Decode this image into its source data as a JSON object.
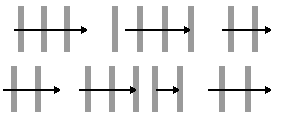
{
  "figure": {
    "width": 281,
    "height": 118,
    "background_color": "#ffffff",
    "bar_color": "#9a9a9a",
    "arrow_color": "#000000",
    "bar_width": 6,
    "arrow_line_thickness": 2,
    "panel_count": 7,
    "rows": 2
  },
  "panels": [
    {
      "id": "panel-1",
      "position": "top-left",
      "bar_count": 3,
      "bars": [
        {
          "x": 18,
          "y": 6,
          "width": 6,
          "height": 46
        },
        {
          "x": 41,
          "y": 6,
          "width": 6,
          "height": 46
        },
        {
          "x": 64,
          "y": 6,
          "width": 6,
          "height": 46
        }
      ],
      "arrow": {
        "x1": 14,
        "x2": 88,
        "y": 30,
        "head_size": 7
      }
    },
    {
      "id": "panel-2",
      "position": "top-middle",
      "bar_count": 4,
      "bars": [
        {
          "x": 112,
          "y": 6,
          "width": 6,
          "height": 46
        },
        {
          "x": 137,
          "y": 6,
          "width": 6,
          "height": 46
        },
        {
          "x": 162,
          "y": 6,
          "width": 6,
          "height": 46
        },
        {
          "x": 188,
          "y": 6,
          "width": 6,
          "height": 46
        }
      ],
      "arrow": {
        "x1": 125,
        "x2": 191,
        "y": 30,
        "head_size": 7
      }
    },
    {
      "id": "panel-3",
      "position": "top-right",
      "bar_count": 2,
      "bars": [
        {
          "x": 228,
          "y": 6,
          "width": 6,
          "height": 46
        },
        {
          "x": 252,
          "y": 6,
          "width": 6,
          "height": 46
        }
      ],
      "arrow": {
        "x1": 222,
        "x2": 272,
        "y": 30,
        "head_size": 7
      }
    },
    {
      "id": "panel-4",
      "position": "bottom-left",
      "bar_count": 2,
      "bars": [
        {
          "x": 11,
          "y": 66,
          "width": 6,
          "height": 46
        },
        {
          "x": 35,
          "y": 66,
          "width": 6,
          "height": 46
        }
      ],
      "arrow": {
        "x1": 3,
        "x2": 61,
        "y": 90,
        "head_size": 7
      }
    },
    {
      "id": "panel-5",
      "position": "bottom-middle-left",
      "bar_count": 3,
      "bars": [
        {
          "x": 85,
          "y": 66,
          "width": 6,
          "height": 46
        },
        {
          "x": 109,
          "y": 66,
          "width": 6,
          "height": 46
        },
        {
          "x": 133,
          "y": 66,
          "width": 6,
          "height": 46
        }
      ],
      "arrow": {
        "x1": 79,
        "x2": 137,
        "y": 90,
        "head_size": 7
      }
    },
    {
      "id": "panel-6",
      "position": "bottom-middle-right",
      "bar_count": 2,
      "bars": [
        {
          "x": 152,
          "y": 66,
          "width": 6,
          "height": 46
        },
        {
          "x": 177,
          "y": 66,
          "width": 6,
          "height": 46
        }
      ],
      "arrow": {
        "x1": 156,
        "x2": 180,
        "y": 90,
        "head_size": 7
      }
    },
    {
      "id": "panel-7",
      "position": "bottom-right",
      "bar_count": 2,
      "bars": [
        {
          "x": 219,
          "y": 66,
          "width": 6,
          "height": 46
        },
        {
          "x": 245,
          "y": 66,
          "width": 6,
          "height": 46
        }
      ],
      "arrow": {
        "x1": 208,
        "x2": 272,
        "y": 90,
        "head_size": 7
      }
    }
  ]
}
